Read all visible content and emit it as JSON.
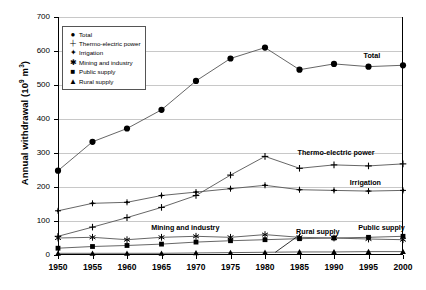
{
  "chart_data": {
    "type": "line",
    "title": "",
    "xlabel": "",
    "ylabel": "Annual withdrawal (10⁹ m³)",
    "ylabel_parts": {
      "main": "Annual withdrawal (10",
      "sup": "9",
      "tail": " m",
      "sup2": "3",
      "close": ")"
    },
    "x": [
      1950,
      1955,
      1960,
      1965,
      1970,
      1975,
      1980,
      1985,
      1990,
      1995,
      2000
    ],
    "categories": [
      "1950",
      "1955",
      "1960",
      "1965",
      "1970",
      "1975",
      "1980",
      "1985",
      "1990",
      "1995",
      "2000"
    ],
    "ylim": [
      0,
      700
    ],
    "yticks": [
      0,
      100,
      200,
      300,
      400,
      500,
      600,
      700
    ],
    "ytick_labels": [
      "0",
      "100",
      "200",
      "300",
      "400",
      "500",
      "600",
      "700"
    ],
    "grid": true,
    "legend_position": "upper-left-inside",
    "series": [
      {
        "name": "Total",
        "marker": "circle",
        "marker_glyph": "●",
        "values": [
          248,
          333,
          372,
          427,
          512,
          578,
          610,
          545,
          562,
          554,
          558
        ]
      },
      {
        "name": "Thermo-electric power",
        "marker": "plus",
        "marker_glyph": "+",
        "values": [
          55,
          82,
          110,
          140,
          175,
          235,
          290,
          255,
          265,
          262,
          268
        ]
      },
      {
        "name": "Irrigation",
        "marker": "dotted-diamond",
        "marker_glyph": "✦",
        "values": [
          130,
          152,
          155,
          175,
          185,
          195,
          205,
          192,
          190,
          188,
          190
        ]
      },
      {
        "name": "Mining and industry",
        "marker": "asterisk",
        "marker_glyph": "✱",
        "values": [
          50,
          52,
          45,
          52,
          55,
          52,
          60,
          52,
          50,
          47,
          45
        ]
      },
      {
        "name": "Public supply",
        "marker": "square",
        "marker_glyph": "■",
        "values": [
          20,
          25,
          28,
          32,
          38,
          42,
          45,
          48,
          50,
          52,
          55
        ]
      },
      {
        "name": "Rural supply",
        "marker": "triangle",
        "marker_glyph": "▲",
        "values": [
          5,
          5,
          5,
          5,
          6,
          7,
          8,
          9,
          9,
          10,
          10
        ]
      }
    ],
    "annotations": [
      {
        "text": "Total",
        "series": "Total"
      },
      {
        "text": "Thermo-electric power",
        "series": "Thermo-electric power"
      },
      {
        "text": "Irrigation",
        "series": "Irrigation"
      },
      {
        "text": "Mining and industry",
        "series": "Mining and industry"
      },
      {
        "text": "Public supply",
        "series": "Public supply"
      },
      {
        "text": "Rural supply",
        "series": "Rural supply"
      }
    ],
    "colors": {
      "line": "#555555",
      "marker": "#000000",
      "grid": "#c8c8c8",
      "axis": "#000000",
      "background": "#ffffff"
    }
  },
  "legend": {
    "items": [
      {
        "label": "Total",
        "glyph": "●"
      },
      {
        "label": "Thermo-electric power",
        "glyph": "＋"
      },
      {
        "label": "Irrigation",
        "glyph": "✦"
      },
      {
        "label": "Mining and industry",
        "glyph": "✱"
      },
      {
        "label": "Public supply",
        "glyph": "■"
      },
      {
        "label": "Rural supply",
        "glyph": "▲"
      }
    ]
  },
  "series_labels": {
    "total": "Total",
    "thermo": "Thermo-electric power",
    "irrigation": "Irrigation",
    "mining": "Mining and industry",
    "public": "Public supply",
    "rural": "Rural supply"
  }
}
